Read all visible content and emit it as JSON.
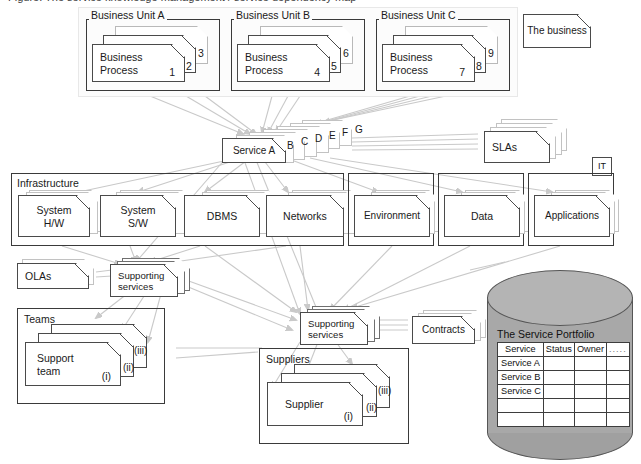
{
  "caption": "Figure: The service knowledge management / service dependency map",
  "business_layer": {
    "units": [
      {
        "label": "Business Unit A",
        "process_label": "Business\nProcess",
        "numbers": [
          "1",
          "2",
          "3"
        ]
      },
      {
        "label": "Business Unit B",
        "process_label": "Business\nProcess",
        "numbers": [
          "4",
          "5",
          "6"
        ]
      },
      {
        "label": "Business Unit C",
        "process_label": "Business\nProcess",
        "numbers": [
          "7",
          "8",
          "9"
        ]
      }
    ],
    "business_box_label": "The business"
  },
  "service_layer": {
    "primary_label": "Service A",
    "stack_labels": [
      "B",
      "C",
      "D",
      "E",
      "F",
      "G"
    ],
    "slas_label": "SLAs",
    "it_tag": "IT"
  },
  "infrastructure": {
    "group_label": "Infrastructure",
    "items": [
      {
        "label": "System\nH/W"
      },
      {
        "label": "System\nS/W"
      },
      {
        "label": "DBMS"
      },
      {
        "label": "Networks"
      }
    ],
    "outer_items": [
      {
        "label": "Environment"
      },
      {
        "label": "Data"
      },
      {
        "label": "Applications"
      }
    ]
  },
  "support_layer": {
    "olas_label": "OLAs",
    "internal_supporting_services_label": "Supporting\nservices",
    "external_supporting_services_label": "Supporting\nservices",
    "contracts_label": "Contracts"
  },
  "teams": {
    "group_label": "Teams",
    "primary_label": "Support\nteam",
    "markers": [
      "(i)",
      "(ii)",
      "(iii)"
    ]
  },
  "suppliers": {
    "group_label": "Suppliers",
    "primary_label": "Supplier",
    "markers": [
      "(i)",
      "(ii)",
      "(iii)"
    ]
  },
  "portfolio": {
    "title": "The Service Portfolio",
    "columns": [
      "Service",
      "Status",
      "Owner",
      "....."
    ],
    "rows": [
      [
        "Service A",
        "",
        "",
        ""
      ],
      [
        "Service B",
        "",
        "",
        ""
      ],
      [
        "Service C",
        "",
        "",
        ""
      ],
      [
        "",
        "",
        "",
        ""
      ],
      [
        "",
        "",
        "",
        ""
      ]
    ]
  },
  "colors": {
    "connector": "#c9c9c9",
    "stroke": "#4a4a4a",
    "cylinder": "#a8a8a8",
    "soft_border": "#e8e8e8"
  }
}
